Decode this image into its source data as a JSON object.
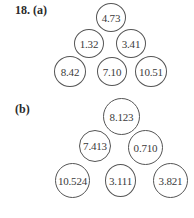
{
  "problem": {
    "number_label": "18. (a)",
    "part_b_label": "(b)"
  },
  "part_a": {
    "rows": [
      [
        "4.73"
      ],
      [
        "1.32",
        "3.41"
      ],
      [
        "8.42",
        "7.10",
        "10.51"
      ]
    ]
  },
  "part_b": {
    "rows": [
      [
        "8.123"
      ],
      [
        "7.413",
        "0.710"
      ],
      [
        "10.524",
        "3.111",
        "3.821"
      ]
    ]
  }
}
